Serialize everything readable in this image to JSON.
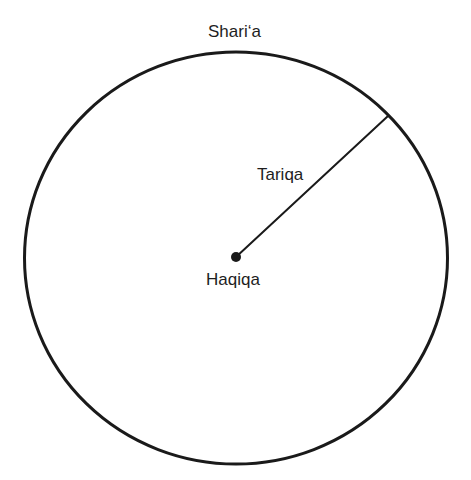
{
  "diagram": {
    "type": "concentric-path",
    "labels": {
      "outer": "Shari‘a",
      "path": "Tariqa",
      "center": "Haqiqa"
    },
    "colors": {
      "stroke": "#1a1a1a",
      "text": "#1e1e1e",
      "background": "#ffffff"
    },
    "shapes": {
      "circle": {
        "cx": 236,
        "cy": 258,
        "rx": 211.5,
        "ry": 206,
        "stroke_width": 3
      },
      "radius_line": {
        "x1": 236,
        "y1": 257,
        "x2": 388,
        "y2": 116,
        "stroke_width": 2
      },
      "center_dot": {
        "cx": 236,
        "cy": 257,
        "r": 5
      }
    }
  }
}
